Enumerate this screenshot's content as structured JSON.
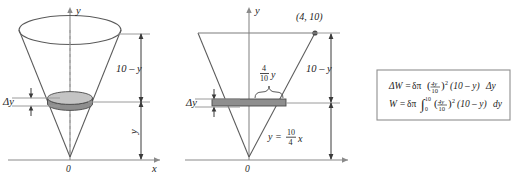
{
  "figure": {
    "title": "",
    "panels": [
      {
        "id": "cone-3d",
        "name": "cone-volume-slice-diagram",
        "axis_x_label": "x",
        "axis_y_label": "y",
        "origin_label": "0",
        "slab_thickness_label": "Δy",
        "upper_distance_label": "10 – y",
        "lower_distance_label": "y"
      },
      {
        "id": "cone-cross-section",
        "name": "cone-cross-section-diagram",
        "axis_x_label": "x",
        "axis_y_label": "y",
        "origin_label": "0",
        "vertex_point_label": "(4, 10)",
        "slab_thickness_label": "Δy",
        "radius_label_numerator": "4",
        "radius_label_denominator": "10",
        "radius_label_variable": "y",
        "upper_distance_label": "10 – y",
        "line_equation_lhs": "y =",
        "line_equation_numerator": "10",
        "line_equation_denominator": "4",
        "line_equation_variable": "x"
      }
    ],
    "equation_box": {
      "name": "work-integral-equations",
      "lines": [
        {
          "id": "delta-w",
          "lhs": "ΔW =",
          "delta_symbol": "δπ",
          "paren_open": "(",
          "frac_num": "4y",
          "frac_den": "10",
          "paren_close": ")",
          "exponent": "2",
          "factor": "(10 – y)",
          "differential": "Δy"
        },
        {
          "id": "w-integral",
          "lhs": "W =",
          "delta_symbol": "δπ",
          "integral_symbol": "∫",
          "integral_upper": "10",
          "integral_lower": "0",
          "paren_open": "(",
          "frac_num": "4y",
          "frac_den": "10",
          "paren_close": ")",
          "exponent": "2",
          "factor": "(10 – y)",
          "differential": "dy"
        }
      ]
    },
    "colors": {
      "stroke": "#5a5a5a",
      "axis": "#8a8a8a",
      "text": "#1c1c1c",
      "slab_fill": "#9d9d9d",
      "slab_top_fill": "#c9c9c9",
      "box_border": "#8f8f8f"
    }
  }
}
